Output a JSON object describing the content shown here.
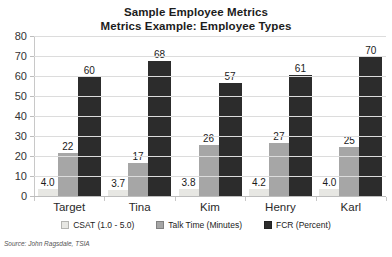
{
  "header": {
    "title": "Sample Employee Metrics",
    "subtitle": "Metrics Example: Employee Types"
  },
  "source_note": "Source: John Ragsdale, TSIA",
  "chart_data": {
    "type": "bar",
    "title": "Sample Employee Metrics",
    "subtitle": "Metrics Example: Employee Types",
    "categories": [
      "Target",
      "Tina",
      "Kim",
      "Henry",
      "Karl"
    ],
    "series": [
      {
        "name": "CSAT  (1.0 - 5.0)",
        "color": "#e7e7e3",
        "values": [
          4.0,
          3.7,
          3.8,
          4.2,
          4.0
        ],
        "labels": [
          "4.0",
          "3.7",
          "3.8",
          "4.2",
          "4.0"
        ]
      },
      {
        "name": "Talk Time (Minutes)",
        "color": "#a6a6a6",
        "values": [
          22,
          17,
          26,
          27,
          25
        ],
        "labels": [
          "22",
          "17",
          "26",
          "27",
          "25"
        ]
      },
      {
        "name": "FCR (Percent)",
        "color": "#2c2c2c",
        "values": [
          60,
          68,
          57,
          61,
          70
        ],
        "labels": [
          "60",
          "68",
          "57",
          "61",
          "70"
        ]
      }
    ],
    "ylim": [
      0,
      80
    ],
    "yticks": [
      0,
      10,
      20,
      30,
      40,
      50,
      60,
      70,
      80
    ],
    "grid": true,
    "legend_position": "bottom",
    "value_labels": true
  }
}
